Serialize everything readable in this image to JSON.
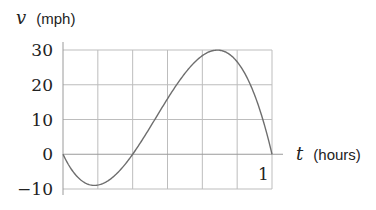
{
  "chart_data": {
    "type": "line",
    "title": "",
    "xlabel_var": "t",
    "xlabel_unit": "(hours)",
    "ylabel_var": "v",
    "ylabel_unit": "(mph)",
    "xlim": [
      0,
      1
    ],
    "ylim": [
      -10,
      30
    ],
    "x_grid_divisions": 6,
    "y_ticks": [
      30,
      20,
      10,
      0,
      -10
    ],
    "y_tick_labels": [
      "30",
      "20",
      "10",
      "0",
      "−10"
    ],
    "x_tick_labels": [
      {
        "value": 1,
        "label": "1"
      }
    ],
    "grid": true,
    "series": [
      {
        "name": "velocity",
        "x": [
          0,
          0.05,
          0.1,
          0.15,
          0.2,
          0.25,
          0.3333,
          0.4,
          0.5,
          0.6,
          0.6667,
          0.7,
          0.75,
          0.8,
          0.85,
          0.9,
          0.95,
          1.0
        ],
        "values": [
          0,
          -5.6,
          -8.6,
          -9.6,
          -9.2,
          -7.5,
          0,
          6.9,
          16,
          24.5,
          28.4,
          29.4,
          30,
          29.1,
          25.8,
          19.8,
          10.5,
          0
        ]
      }
    ],
    "annotations": {
      "min": {
        "t": 0.14,
        "v": -10
      },
      "zero_crossing": {
        "t": 0.3333,
        "v": 0
      },
      "max": {
        "t": 0.72,
        "v": 30
      }
    }
  }
}
